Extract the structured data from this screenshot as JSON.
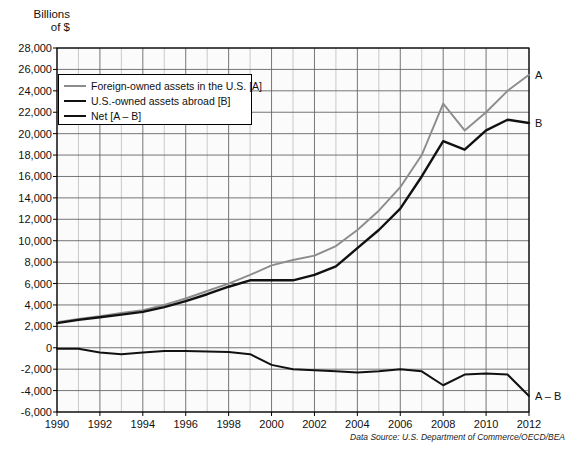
{
  "chart_data": {
    "type": "line",
    "title": "",
    "xlabel": "",
    "ylabel": "Billions\nof $",
    "xlim": [
      1990,
      2012
    ],
    "ylim": [
      -6000,
      28000
    ],
    "ytick_step": 2000,
    "xtick_step": 2,
    "grid": true,
    "minor_x_grid_step": 1,
    "legend_position": "top-left-inside",
    "source_note": "Data Source: U.S. Department of Commerce/OECD/BEA",
    "x": [
      1990,
      1991,
      1992,
      1993,
      1994,
      1995,
      1996,
      1997,
      1998,
      1999,
      2000,
      2001,
      2002,
      2003,
      2004,
      2005,
      2006,
      2007,
      2008,
      2009,
      2010,
      2011,
      2012
    ],
    "ytick_labels": [
      "28,000",
      "26,000",
      "24,000",
      "22,000",
      "20,000",
      "18,000",
      "16,000",
      "14,000",
      "12,000",
      "10,000",
      "8,000",
      "6,000",
      "4,000",
      "2,000",
      "0",
      "-2,000",
      "-4,000",
      "-6,000"
    ],
    "ytick_values": [
      28000,
      26000,
      24000,
      22000,
      20000,
      18000,
      16000,
      14000,
      12000,
      10000,
      8000,
      6000,
      4000,
      2000,
      0,
      -2000,
      -4000,
      -6000
    ],
    "xtick_labels": [
      "1990",
      "1992",
      "1994",
      "1996",
      "1998",
      "2000",
      "2002",
      "2004",
      "2006",
      "2008",
      "2010",
      "2012"
    ],
    "xtick_values": [
      1990,
      1992,
      1994,
      1996,
      1998,
      2000,
      2002,
      2004,
      2006,
      2008,
      2010,
      2012
    ],
    "series": [
      {
        "name": "Foreign-owned assets in the U.S. [A]",
        "key": "A",
        "color": "#8c8c8c",
        "width": 1.9,
        "end_label": "A",
        "values": [
          2400,
          2700,
          2950,
          3250,
          3500,
          4000,
          4600,
          5300,
          6000,
          6800,
          7700,
          8200,
          8600,
          9500,
          11000,
          12800,
          15000,
          18000,
          22800,
          20300,
          22000,
          24000,
          25500
        ]
      },
      {
        "name": "U.S.-owned assets abroad [B]",
        "key": "B",
        "color": "#111111",
        "width": 2.4,
        "end_label": "B",
        "values": [
          2300,
          2600,
          2850,
          3100,
          3350,
          3800,
          4350,
          5000,
          5700,
          6300,
          6300,
          6300,
          6800,
          7600,
          9300,
          11000,
          13000,
          16000,
          19300,
          18500,
          20300,
          21300,
          21000
        ]
      },
      {
        "name": "Net [A – B]",
        "key": "A-B",
        "color": "#111111",
        "width": 2.0,
        "end_label": "A – B",
        "values": [
          -100,
          -100,
          -450,
          -600,
          -450,
          -300,
          -300,
          -350,
          -400,
          -600,
          -1600,
          -2000,
          -2100,
          -2200,
          -2300,
          -2200,
          -2000,
          -2200,
          -3500,
          -2500,
          -2400,
          -2500,
          -4500
        ]
      }
    ],
    "annotations": [
      {
        "text": "A",
        "series": "A",
        "at_x": 2012,
        "at_y": 25500
      },
      {
        "text": "B",
        "series": "B",
        "at_x": 2012,
        "at_y": 21000
      },
      {
        "text": "A – B",
        "series": "A-B",
        "at_x": 2012,
        "at_y": -4500
      }
    ]
  },
  "legend": {
    "items": [
      {
        "label": "Foreign-owned assets in the U.S. [A]"
      },
      {
        "label": "U.S.-owned assets abroad [B]"
      },
      {
        "label": "Net [A – B]"
      }
    ]
  },
  "axis": {
    "y_title_line1": "Billions",
    "y_title_line2": "of $"
  }
}
